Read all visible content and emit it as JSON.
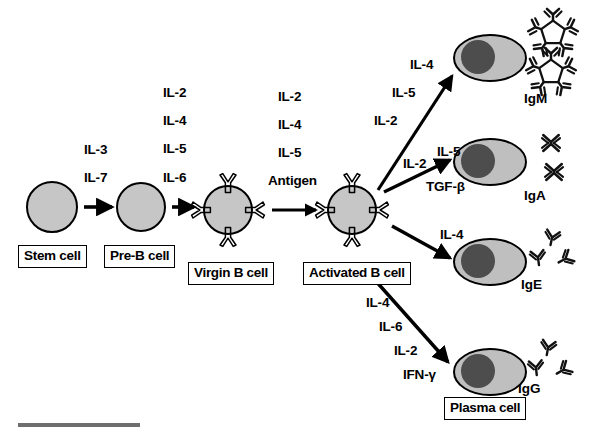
{
  "figure": {
    "colors": {
      "cell_fill": "#c6c6c6",
      "nucleus_fill": "#4d4d4d",
      "plasma_fill": "#bfbfbf",
      "outline": "#000000",
      "scalebar": "#6e6e6e",
      "background": "#ffffff"
    }
  },
  "cells": [
    {
      "id": "stem",
      "label": "Stem cell",
      "type": "plain-circle"
    },
    {
      "id": "preb",
      "label": "Pre-B cell",
      "type": "plain-circle"
    },
    {
      "id": "virgin",
      "label": "Virgin B cell",
      "type": "receptor-circle"
    },
    {
      "id": "activated",
      "label": "Activated B cell",
      "type": "receptor-circle"
    },
    {
      "id": "plasma",
      "label": "Plasma cell",
      "type": "plasma-oval"
    }
  ],
  "transitions": [
    {
      "id": "stem-to-preb",
      "cytokines": [
        "IL-3",
        "IL-7"
      ]
    },
    {
      "id": "preb-to-virgin",
      "cytokines": [
        "IL-2",
        "IL-4",
        "IL-5",
        "IL-6"
      ]
    },
    {
      "id": "virgin-to-activated",
      "cytokines": [
        "IL-2",
        "IL-4",
        "IL-5",
        "Antigen"
      ]
    },
    {
      "id": "activated-to-igm",
      "cytokines": [
        "IL-4",
        "IL-5",
        "IL-2"
      ]
    },
    {
      "id": "activated-to-iga",
      "cytokines": [
        "IL-2",
        "IL-5",
        "TGF-β"
      ]
    },
    {
      "id": "activated-to-ige",
      "cytokines": [
        "IL-4"
      ]
    },
    {
      "id": "activated-to-igg",
      "cytokines": [
        "IL-4",
        "IL-6",
        "IL-2",
        "IFN-γ"
      ]
    }
  ],
  "antibodies": [
    {
      "id": "igm",
      "label": "IgM",
      "form": "pentamer",
      "count": 2
    },
    {
      "id": "iga",
      "label": "IgA",
      "form": "dimer",
      "count": 2
    },
    {
      "id": "ige",
      "label": "IgE",
      "form": "monomer",
      "count": 3
    },
    {
      "id": "igg",
      "label": "IgG",
      "form": "monomer",
      "count": 3
    }
  ],
  "labels": {
    "stem_cell": "Stem cell",
    "pre_b_cell": "Pre-B cell",
    "virgin_b_cell": "Virgin B cell",
    "activated_b_cell": "Activated B cell",
    "plasma_cell": "Plasma cell",
    "igm": "IgM",
    "iga": "IgA",
    "ige": "IgE",
    "igg": "IgG",
    "il3": "IL-3",
    "il7": "IL-7",
    "il2_a": "IL-2",
    "il4_a": "IL-4",
    "il5_a": "IL-5",
    "il6_a": "IL-6",
    "il2_b": "IL-2",
    "il4_b": "IL-4",
    "il5_b": "IL-5",
    "antigen": "Antigen",
    "il4_m": "IL-4",
    "il5_m": "IL-5",
    "il2_m": "IL-2",
    "il2_aa": "IL-2",
    "il5_aa": "IL-5",
    "tgfb": "TGF-β",
    "il4_e": "IL-4",
    "il4_g": "IL-4",
    "il6_g": "IL-6",
    "il2_g": "IL-2",
    "ifng": "IFN-γ"
  }
}
